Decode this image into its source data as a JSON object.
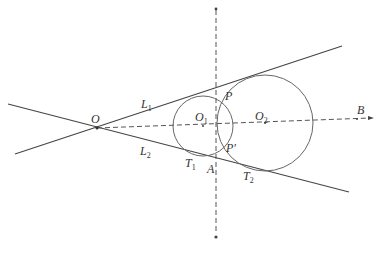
{
  "diagram": {
    "colors": {
      "line": "#444444",
      "circle": "#666666",
      "dashed": "#555555",
      "text": "#333333"
    },
    "points": {
      "O": {
        "label": "O",
        "x": 97,
        "y": 128
      },
      "O1": {
        "label": "O",
        "sub": "1",
        "x": 203,
        "y": 126
      },
      "O2": {
        "label": "O",
        "sub": "2",
        "x": 265,
        "y": 123
      },
      "P": {
        "label": "P",
        "x": 216,
        "y": 95
      },
      "P_prime": {
        "label": "P′",
        "x": 216,
        "y": 157
      },
      "A": {
        "label": "A",
        "x": 216,
        "y": 163
      },
      "T1": {
        "label": "T",
        "sub": "1",
        "x": 190,
        "y": 155
      },
      "T2": {
        "label": "T",
        "sub": "2",
        "x": 244,
        "y": 164
      },
      "B": {
        "label": "B",
        "x": 357,
        "y": 119
      }
    },
    "lines": {
      "L1": {
        "label": "L",
        "sub": "1"
      },
      "L2": {
        "label": "L",
        "sub": "2"
      }
    },
    "labels": {
      "O": "O",
      "O1": "O",
      "O1_sub": "1",
      "O2": "O",
      "O2_sub": "2",
      "P": "P",
      "P_prime": "P′",
      "A": "A",
      "T1": "T",
      "T1_sub": "1",
      "T2": "T",
      "T2_sub": "2",
      "B": "B",
      "L1": "L",
      "L1_sub": "1",
      "L2": "L",
      "L2_sub": "2"
    }
  }
}
